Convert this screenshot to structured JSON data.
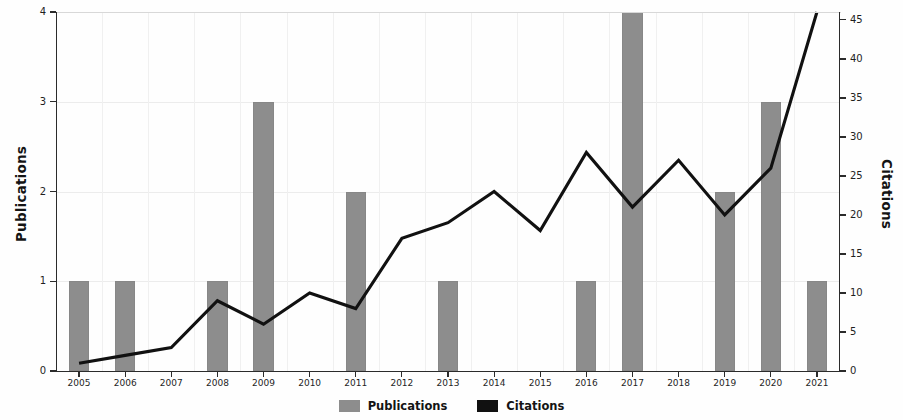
{
  "chart_data": {
    "type": "bar",
    "title": "",
    "xlabel": "",
    "ylabel": "Publications",
    "y2label": "Citations",
    "grid": true,
    "legend_position": "bottom-center",
    "categories": [
      "2005",
      "2006",
      "2007",
      "2008",
      "2009",
      "2010",
      "2011",
      "2012",
      "2013",
      "2014",
      "2015",
      "2016",
      "2017",
      "2018",
      "2019",
      "2020",
      "2021"
    ],
    "ylim": [
      0,
      4
    ],
    "y2lim": [
      0,
      46
    ],
    "yticks": [
      "0",
      "1",
      "2",
      "3",
      "4"
    ],
    "y2ticks": [
      "0",
      "5",
      "10",
      "15",
      "20",
      "25",
      "30",
      "35",
      "40",
      "45"
    ],
    "series": [
      {
        "name": "Publications",
        "type": "bar",
        "axis": "left",
        "color": "#8d8d8d",
        "values": [
          1,
          1,
          0,
          1,
          3,
          0,
          2,
          0,
          1,
          0,
          0,
          1,
          4,
          0,
          2,
          3,
          1
        ]
      },
      {
        "name": "Citations",
        "type": "line",
        "axis": "right",
        "color": "#111111",
        "values": [
          1,
          2,
          3,
          9,
          6,
          10,
          8,
          17,
          19,
          23,
          18,
          28,
          21,
          27,
          20,
          26,
          46
        ]
      }
    ]
  },
  "legend": {
    "entries": [
      {
        "label": "Publications",
        "color": "#8d8d8d"
      },
      {
        "label": "Citations",
        "color": "#111111"
      }
    ]
  },
  "axes": {
    "left_title": "Publications",
    "right_title": "Citations"
  }
}
